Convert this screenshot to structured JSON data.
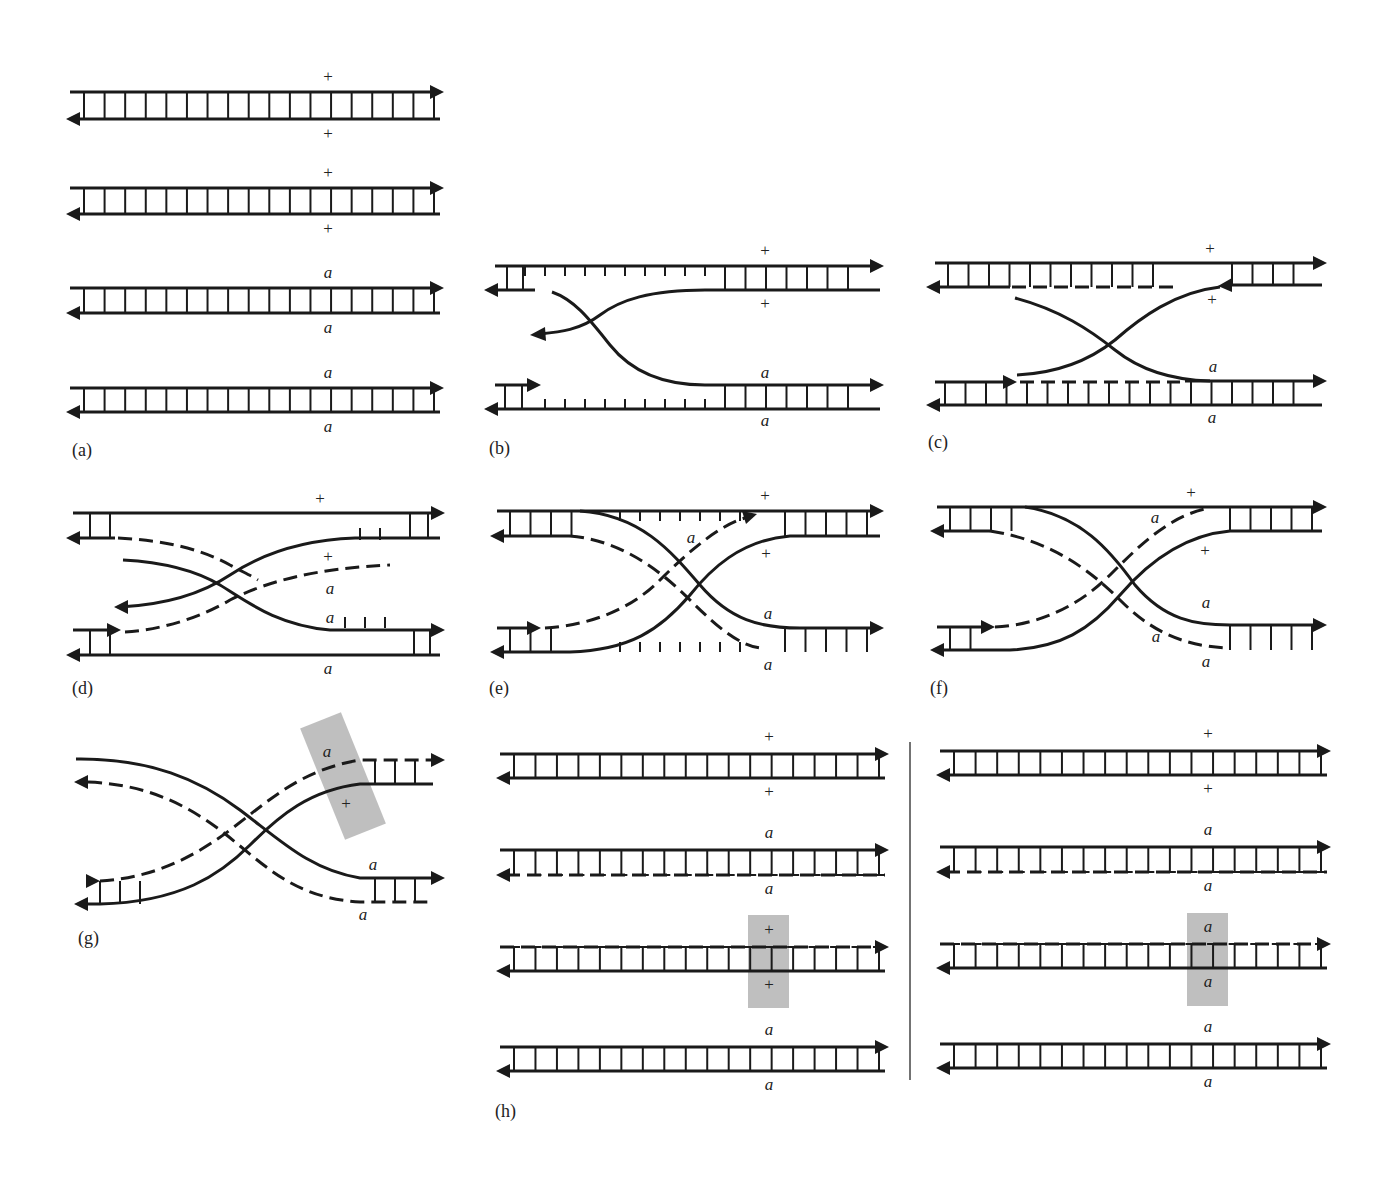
{
  "figure": {
    "panels": [
      {
        "id": "a",
        "label": "(a)",
        "description": "Four parallel DNA duplexes (two homologous chromatids each)",
        "duplexes": [
          {
            "top_allele": "+",
            "bottom_allele": "+"
          },
          {
            "top_allele": "+",
            "bottom_allele": "+"
          },
          {
            "top_allele": "a",
            "bottom_allele": "a"
          },
          {
            "top_allele": "a",
            "bottom_allele": "a"
          }
        ]
      },
      {
        "id": "b",
        "label": "(b)",
        "description": "Single-strand nicks; strand invasion begins",
        "alleles": {
          "upper_top": "+",
          "upper_bottom": "+",
          "lower_top": "a",
          "lower_bottom": "a"
        }
      },
      {
        "id": "c",
        "label": "(c)",
        "description": "Strand exchange; crossing strands with dashed newly synthesized segments",
        "alleles": {
          "upper_top": "+",
          "upper_bottom": "+",
          "lower_top": "a",
          "lower_bottom": "a"
        }
      },
      {
        "id": "d",
        "label": "(d)",
        "description": "Branch migration; heteroduplex forming",
        "alleles": {
          "upper_top": "+",
          "mid_plus": "+",
          "mid_a1": "a",
          "mid_a2": "a",
          "lower_bottom": "a"
        }
      },
      {
        "id": "e",
        "label": "(e)",
        "description": "Holliday junction formed",
        "alleles": {
          "upper_top": "+",
          "mid_a": "a",
          "upper_bottom": "+",
          "lower_top": "a",
          "lower_bottom": "a"
        }
      },
      {
        "id": "f",
        "label": "(f)",
        "description": "Branch migration extends heteroduplex",
        "alleles": {
          "upper_top": "+",
          "mid_a_top": "a",
          "upper_bottom": "+",
          "lower_top": "a",
          "mid_a_bottom": "a",
          "lower_bottom": "a"
        }
      },
      {
        "id": "g",
        "label": "(g)",
        "description": "Isomerized Holliday junction; mismatch highlighted",
        "alleles": {
          "highlight_top": "a",
          "highlight_bottom": "+",
          "lower_top": "a",
          "lower_bottom": "a"
        }
      },
      {
        "id": "h",
        "label": "(h)",
        "description": "Resolution products; left: mismatch corrected to +, right: corrected to a",
        "left": [
          {
            "top_allele": "+",
            "bottom_allele": "+"
          },
          {
            "top_allele": "a",
            "bottom_allele": "a"
          },
          {
            "top_allele": "+",
            "bottom_allele": "+",
            "highlighted": true
          },
          {
            "top_allele": "a",
            "bottom_allele": "a"
          }
        ],
        "right": [
          {
            "top_allele": "+",
            "bottom_allele": "+"
          },
          {
            "top_allele": "a",
            "bottom_allele": "a"
          },
          {
            "top_allele": "a",
            "bottom_allele": "a",
            "highlighted": true
          },
          {
            "top_allele": "a",
            "bottom_allele": "a"
          }
        ]
      }
    ],
    "colors": {
      "ink": "#1a1a1a",
      "highlight": "#b4b4b4",
      "background": "#ffffff"
    }
  }
}
